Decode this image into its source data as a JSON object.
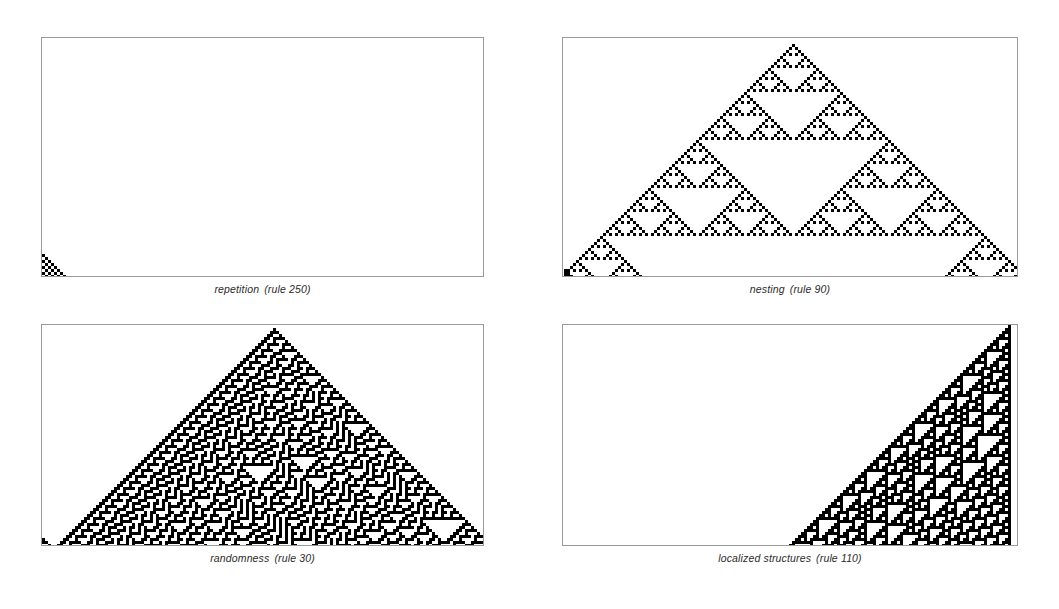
{
  "figure": {
    "background_color": "#ffffff",
    "border_color": "#9a9a9a",
    "cell_color": "#000000",
    "panel_count": 4
  },
  "panels": [
    {
      "id": "panel-repetition",
      "caption_name": "repetition",
      "caption_rule": "(rule 250)",
      "rule": 250,
      "class_label": "repetition",
      "frame": {
        "x": 41,
        "y": 37,
        "w": 443,
        "h": 240
      },
      "caption": {
        "y": 283
      },
      "cell_size": 3,
      "cols": 147,
      "rows": 80,
      "origin_col": 77,
      "start_row": 2,
      "shade": "checker"
    },
    {
      "id": "panel-nesting",
      "caption_name": "nesting",
      "caption_rule": "(rule 90)",
      "rule": 90,
      "class_label": "nesting",
      "frame": {
        "x": 562,
        "y": 37,
        "w": 456,
        "h": 240
      },
      "caption": {
        "y": 283
      },
      "cell_size": 3,
      "cols": 151,
      "rows": 80,
      "origin_col": 76,
      "start_row": 2,
      "shade": "solid"
    },
    {
      "id": "panel-randomness",
      "caption_name": "randomness",
      "caption_rule": "(rule 30)",
      "rule": 30,
      "class_label": "randomness",
      "frame": {
        "x": 41,
        "y": 324,
        "w": 443,
        "h": 222
      },
      "caption": {
        "y": 552
      },
      "cell_size": 3,
      "cols": 147,
      "rows": 74,
      "origin_col": 77,
      "start_row": 1,
      "shade": "solid"
    },
    {
      "id": "panel-localized",
      "caption_name": "localized structures",
      "caption_rule": "(rule 110)",
      "rule": 110,
      "class_label": "localized structures",
      "frame": {
        "x": 562,
        "y": 324,
        "w": 456,
        "h": 222
      },
      "caption": {
        "y": 552
      },
      "cell_size": 3,
      "cols": 151,
      "rows": 74,
      "origin_col": 148,
      "start_row": 0,
      "shade": "solid"
    }
  ]
}
